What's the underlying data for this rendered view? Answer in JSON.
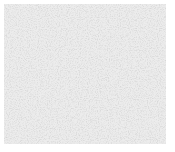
{
  "texture": {
    "kind": "noise",
    "base_color": "#e6e6e6",
    "border_color": "#ffffff"
  }
}
